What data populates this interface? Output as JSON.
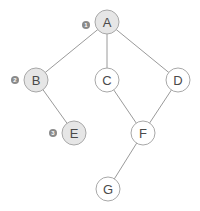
{
  "diagram": {
    "type": "tree-graph",
    "colors": {
      "visited_fill": "#e6e6e6",
      "unvisited_fill": "#ffffff",
      "node_stroke": "#a8a8a8",
      "edge": "#9a9a9a",
      "badge": "#8a8a8a",
      "label": "#4a4a4a"
    },
    "nodes": [
      {
        "id": "A",
        "label": "A",
        "x": 107,
        "y": 22,
        "visited": true,
        "order": "1"
      },
      {
        "id": "B",
        "label": "B",
        "x": 36,
        "y": 80,
        "visited": true,
        "order": "2"
      },
      {
        "id": "C",
        "label": "C",
        "x": 107,
        "y": 80,
        "visited": false,
        "order": null
      },
      {
        "id": "D",
        "label": "D",
        "x": 178,
        "y": 80,
        "visited": false,
        "order": null
      },
      {
        "id": "E",
        "label": "E",
        "x": 74,
        "y": 133,
        "visited": true,
        "order": "3"
      },
      {
        "id": "F",
        "label": "F",
        "x": 143,
        "y": 133,
        "visited": false,
        "order": null
      },
      {
        "id": "G",
        "label": "G",
        "x": 108,
        "y": 189,
        "visited": false,
        "order": null
      }
    ],
    "edges": [
      [
        "A",
        "B"
      ],
      [
        "A",
        "C"
      ],
      [
        "A",
        "D"
      ],
      [
        "B",
        "E"
      ],
      [
        "C",
        "F"
      ],
      [
        "D",
        "F"
      ],
      [
        "F",
        "G"
      ]
    ],
    "node_radius": 12,
    "badge_radius": 4,
    "badge_offset_x": -21
  }
}
